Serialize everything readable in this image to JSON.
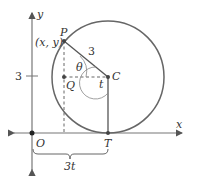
{
  "diagram": {
    "type": "geometry",
    "colors": {
      "stroke": "#555555",
      "text": "#333333",
      "background": "#ffffff"
    },
    "axes": {
      "x_label": "x",
      "y_label": "y",
      "origin_label": "O",
      "y_tick_label": "3"
    },
    "points": {
      "P": {
        "label": "P",
        "coord_label": "(x, y)"
      },
      "Q": {
        "label": "Q"
      },
      "C": {
        "label": "C"
      },
      "T": {
        "label": "T"
      },
      "O": {
        "label": "O"
      }
    },
    "segment_labels": {
      "radius": "3",
      "angle_theta": "θ",
      "angle_t": "t",
      "arc_length": "3t"
    }
  }
}
